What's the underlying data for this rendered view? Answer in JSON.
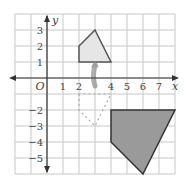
{
  "diagram": {
    "type": "coordinate-grid-transformation",
    "grid": {
      "x_min": -2,
      "x_max": 8,
      "y_min": -6,
      "y_max": 4,
      "x_ticks": [
        "1",
        "2",
        "4",
        "5",
        "6",
        "7"
      ],
      "y_ticks": [
        "3",
        "2",
        "1",
        "-2",
        "-3",
        "-4",
        "-5"
      ],
      "origin_label": "O",
      "x_axis_label": "x",
      "y_axis_label": "y"
    },
    "shapes": {
      "small_shape": {
        "vertices": [
          [
            2,
            1
          ],
          [
            2,
            2
          ],
          [
            3,
            3
          ],
          [
            4,
            1
          ]
        ],
        "fill": "#e6e6e6",
        "stroke": "#555555"
      },
      "dashed_image": {
        "vertices": [
          [
            2,
            -1
          ],
          [
            2,
            -2
          ],
          [
            3,
            -3
          ],
          [
            4,
            -1
          ]
        ],
        "style": "dashed",
        "stroke": "#aaaaaa"
      },
      "large_shape": {
        "vertices": [
          [
            4,
            -2
          ],
          [
            8,
            -2
          ],
          [
            6,
            -6
          ],
          [
            4,
            -4
          ]
        ],
        "fill": "#9a9a9a",
        "stroke": "#333333"
      }
    },
    "arrow": {
      "from": [
        3,
        -0.5
      ],
      "to": [
        3,
        0.8
      ],
      "color": "#999999"
    },
    "colors": {
      "grid": "#c8c8c8",
      "axis": "#333333",
      "background": "#ffffff"
    }
  }
}
